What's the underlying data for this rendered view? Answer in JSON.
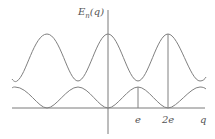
{
  "diagram": {
    "y_axis_label": {
      "main": "E",
      "subscript": "n",
      "arg": "(q)"
    },
    "x_axis_label": "q",
    "ticks": [
      {
        "label": "e",
        "x": 138
      },
      {
        "label": "2e",
        "x": 168
      }
    ],
    "colors": {
      "curve": "#808080",
      "axis": "#7a7a7a",
      "text": "#555555"
    },
    "curves": [
      {
        "name": "upper-band",
        "peak_y": 34,
        "trough_y": 81,
        "peaks_x": [
          47,
          108,
          168
        ],
        "troughs_x": [
          15,
          78,
          138,
          200
        ]
      },
      {
        "name": "lower-band",
        "peak_y": 87,
        "trough_y": 108,
        "peaks_x": [
          15,
          78,
          138,
          200
        ],
        "troughs_x": [
          47,
          108,
          168
        ]
      }
    ]
  }
}
